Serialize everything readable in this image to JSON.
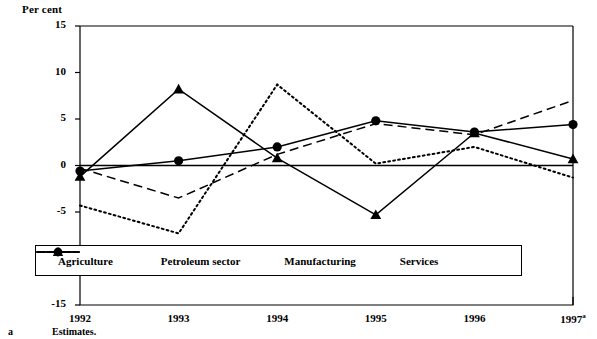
{
  "chart_data": {
    "type": "line",
    "title": "",
    "ylabel": "Per cent",
    "xlabel": "",
    "categories": [
      "1992",
      "1993",
      "1994",
      "1995",
      "1996",
      "1997"
    ],
    "last_category_superscript": "a",
    "ylim": [
      -15,
      15
    ],
    "yticks": [
      15,
      10,
      5,
      0,
      -5,
      -10,
      -15
    ],
    "grid": false,
    "zero_line": true,
    "legend_position": "bottom-inside",
    "series": [
      {
        "name": "Agriculture",
        "style": "solid",
        "marker": "triangle",
        "values": [
          -1.2,
          8.2,
          0.8,
          -5.3,
          3.5,
          0.7
        ]
      },
      {
        "name": "Petroleum sector",
        "style": "dotted",
        "marker": "none",
        "values": [
          -4.3,
          -7.3,
          8.7,
          0.2,
          2.0,
          -1.3
        ]
      },
      {
        "name": "Manufacturing",
        "style": "dashed",
        "marker": "none",
        "values": [
          -0.3,
          -3.5,
          1.2,
          4.5,
          3.3,
          7.0
        ]
      },
      {
        "name": "Services",
        "style": "solid",
        "marker": "circle",
        "values": [
          -0.6,
          0.5,
          2.0,
          4.8,
          3.6,
          4.4
        ]
      }
    ]
  },
  "footnote": {
    "mark": "a",
    "text": "Estimates."
  },
  "colors": {
    "line": "#000000",
    "axis": "#000000",
    "background": "#ffffff"
  }
}
